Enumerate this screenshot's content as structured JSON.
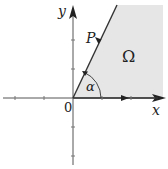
{
  "diagram": {
    "title": "",
    "axes": {
      "x_label": "x",
      "y_label": "y",
      "origin_label": "0"
    },
    "ray": {
      "label": "P",
      "direction": "downward toward origin"
    },
    "angle": {
      "label": "α"
    },
    "region": {
      "label": "Ω",
      "fill": "#e6e6e6"
    },
    "colors": {
      "stroke": "#333333",
      "axis": "#555555"
    }
  }
}
